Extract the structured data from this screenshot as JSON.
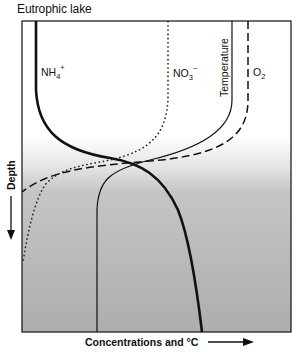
{
  "title": "Eutrophic lake",
  "axes": {
    "y_label": "Depth",
    "y_direction": "down",
    "x_label": "Concentrations and °C",
    "x_direction": "right"
  },
  "curves": [
    {
      "name": "NH4+",
      "label_main": "NH",
      "label_sub": "4",
      "label_sup": "+",
      "style": "solid-thick",
      "trend": "low at surface, increases with depth"
    },
    {
      "name": "NO3-",
      "label_main": "NO",
      "label_sub": "3",
      "label_sup": "−",
      "style": "dotted",
      "trend": "high at surface, decreases to near zero at depth"
    },
    {
      "name": "Temperature",
      "label_main": "Temperature",
      "style": "solid-thin",
      "trend": "warm at surface, drops sharply at thermocline, cold at depth"
    },
    {
      "name": "O2",
      "label_main": "O",
      "label_sub": "2",
      "style": "dashed",
      "trend": "high at surface, drops to zero below thermocline"
    }
  ],
  "shading": {
    "surface_color": "#ffffff",
    "deep_color": "#b2b2b2",
    "transition_zone": "thermocline"
  }
}
